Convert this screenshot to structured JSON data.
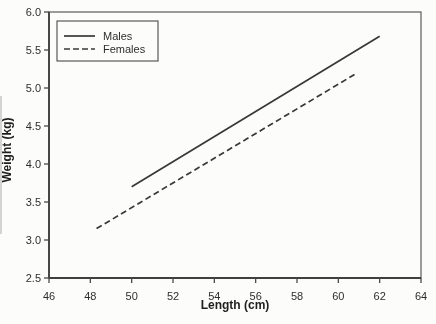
{
  "figure": {
    "background_color": "#fcfcfb"
  },
  "chart_data": {
    "type": "line",
    "title": "",
    "xlabel": "Length (cm)",
    "ylabel": "Weight (kg)",
    "xlim": [
      46,
      64
    ],
    "ylim": [
      2.5,
      6.0
    ],
    "grid": false,
    "xticks": {
      "values": [
        46,
        48,
        50,
        52,
        54,
        56,
        58,
        60,
        62,
        64
      ],
      "labels": [
        "46",
        "48",
        "50",
        "52",
        "54",
        "56",
        "58",
        "60",
        "62",
        "64"
      ]
    },
    "yticks": {
      "values": [
        2.5,
        3.0,
        3.5,
        4.0,
        4.5,
        5.0,
        5.5,
        6.0
      ],
      "labels": [
        "2.5",
        "3.0",
        "3.5",
        "4.0",
        "4.5",
        "5.0",
        "5.5",
        "6.0"
      ]
    },
    "legend": {
      "position": "upper-left",
      "entries": [
        "Males",
        "Females"
      ]
    },
    "line_color": "#383838",
    "series": [
      {
        "name": "Males",
        "line_style": "solid",
        "color": "#383838",
        "points": [
          [
            50.0,
            3.7
          ],
          [
            62.0,
            5.68
          ]
        ]
      },
      {
        "name": "Females",
        "line_style": "dashed",
        "color": "#383838",
        "points": [
          [
            48.3,
            3.15
          ],
          [
            60.8,
            5.18
          ]
        ]
      }
    ]
  }
}
